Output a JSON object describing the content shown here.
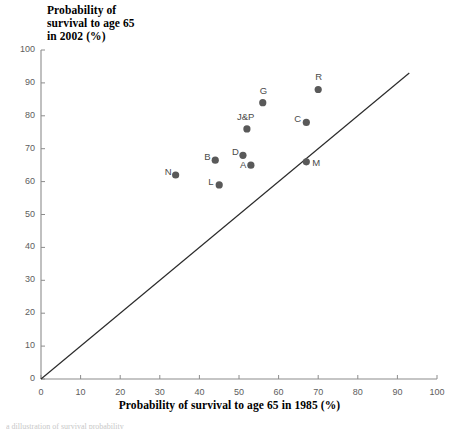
{
  "chart_data": {
    "type": "scatter",
    "title": "",
    "xlabel": "Probability of survival to age 65 in 1985 (%)",
    "ylabel_lines": [
      "Probability of",
      "survival to age 65",
      "in 2002 (%)"
    ],
    "ylabel": "Probability of survival to age 65 in 2002 (%)",
    "xlim": [
      0,
      100
    ],
    "ylim": [
      0,
      100
    ],
    "xticks": [
      0,
      10,
      20,
      30,
      40,
      50,
      60,
      70,
      80,
      90,
      100
    ],
    "yticks": [
      0,
      10,
      20,
      30,
      40,
      50,
      60,
      70,
      80,
      90,
      100
    ],
    "grid": false,
    "legend": "none",
    "marker_color": "#595959",
    "line_color": "#2b2b2b",
    "axis_color": "#8c8c8c",
    "reference_line": {
      "name": "y = x diagonal",
      "from": [
        0,
        0
      ],
      "to": [
        93,
        93
      ]
    },
    "points": [
      {
        "label": "R",
        "x": 70,
        "y": 88,
        "label_dx": -3,
        "label_dy": -13
      },
      {
        "label": "G",
        "x": 56,
        "y": 84,
        "label_dx": -3,
        "label_dy": -13
      },
      {
        "label": "C",
        "x": 67,
        "y": 78,
        "label_dx": -12,
        "label_dy": -4
      },
      {
        "label": "J&P",
        "x": 52,
        "y": 76,
        "label_dx": -10,
        "label_dy": -13
      },
      {
        "label": "D",
        "x": 51,
        "y": 68,
        "label_dx": -11,
        "label_dy": -4
      },
      {
        "label": "M",
        "x": 67,
        "y": 66,
        "label_dx": 6,
        "label_dy": 0
      },
      {
        "label": "B",
        "x": 44,
        "y": 66.5,
        "label_dx": -11,
        "label_dy": -4
      },
      {
        "label": "A",
        "x": 53,
        "y": 65,
        "label_dx": -11,
        "label_dy": -1
      },
      {
        "label": "N",
        "x": 34,
        "y": 62,
        "label_dx": -11,
        "label_dy": -4
      },
      {
        "label": "L",
        "x": 45,
        "y": 59,
        "label_dx": -11,
        "label_dy": -4
      }
    ]
  },
  "caption_sliver": "a dillustration of survival probability"
}
